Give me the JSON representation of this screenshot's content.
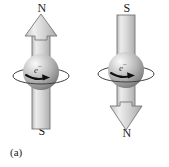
{
  "figure": {
    "type": "physics-diagram",
    "background_color": "#ffffff",
    "width": 169,
    "height": 167
  },
  "colors": {
    "ink": "#1a1a1a",
    "arrow_fill_light": "#e3e3e3",
    "arrow_fill_mid": "#c9c9c9",
    "arrow_fill_dark": "#a9a9a9",
    "arrow_outline": "#6f6f6f",
    "sphere_highlight": "#f2f2f2",
    "sphere_mid": "#b8b8b8",
    "sphere_shadow": "#6b6b6b",
    "ring_stroke": "#3d3d3d",
    "spin_arrow": "#111111"
  },
  "panels": [
    {
      "id": "a",
      "caption": "(a)",
      "top_pole_label": "N",
      "bottom_pole_label": "S",
      "arrow_direction": "up",
      "particle_label": "e",
      "particle_charge": "−",
      "spin_ring": "equatorial-ellipse",
      "spin_arrow_direction": "right"
    },
    {
      "id": "b",
      "caption": "(b)",
      "top_pole_label": "S",
      "bottom_pole_label": "N",
      "arrow_direction": "down",
      "particle_label": "e",
      "particle_charge": "−",
      "spin_ring": "equatorial-ellipse",
      "spin_arrow_direction": "right"
    }
  ]
}
